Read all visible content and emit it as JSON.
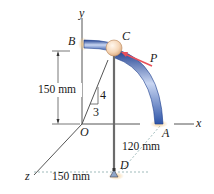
{
  "figure": {
    "points": {
      "B": "B",
      "C": "C",
      "P": "P",
      "O": "O",
      "A": "A",
      "D": "D"
    },
    "axes": {
      "x": "x",
      "y": "y",
      "z": "z"
    },
    "dimensions": {
      "height_BO": "150 mm",
      "OA": "120 mm",
      "z_offset": "150 mm"
    },
    "slope": {
      "rise": "4",
      "run": "3"
    },
    "colors": {
      "rod_blue": "#3b63b8",
      "rod_highlight": "#c9d6f2",
      "ball": "#f6d7b8",
      "force_arrow": "#e8505b",
      "support_glow": "#f2c98a",
      "cable": "#6b6b6b"
    }
  }
}
